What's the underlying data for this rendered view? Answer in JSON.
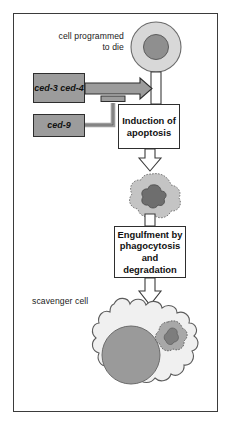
{
  "figure": {
    "frame_border_color": "#3b3b3b",
    "background_color": "#ffffff"
  },
  "labels": {
    "dying_cell": "cell programmed\nto die",
    "scavenger_cell": "scavenger cell"
  },
  "gene_boxes": [
    {
      "id": "ced-3-ced-4",
      "lines": "ced-3\nced-4",
      "fill": "#9c9c9c",
      "role": "activator"
    },
    {
      "id": "ced-9",
      "lines": "ced-9",
      "fill": "#9c9c9c",
      "role": "inhibitor"
    }
  ],
  "process_boxes": [
    {
      "id": "induction-of-apoptosis",
      "lines": "Induction\nof\napoptosis"
    },
    {
      "id": "engulfment-by-phagocytosis",
      "lines": "Engulfment by\nphagocytosis\nand\ndegradation"
    }
  ],
  "cells": {
    "healthy": {
      "cytoplasm_fill": "#d8d8d8",
      "nucleus_fill": "#8f8f8f"
    },
    "apoptotic_body": {
      "cytoplasm_fill": "#c4c4c4",
      "nucleus_fill": "#6e6e6e"
    },
    "scavenger": {
      "cytoplasm_fill": "#f0f0f0",
      "nucleus_fill": "#9a9a9a",
      "engulfed_fill": "#a8a8a8"
    }
  },
  "arrows": {
    "activation_arrow_fill": "#9c9c9c",
    "flow_arrow_fill": "#ffffff",
    "inhibition_symbol": "T-bar"
  }
}
